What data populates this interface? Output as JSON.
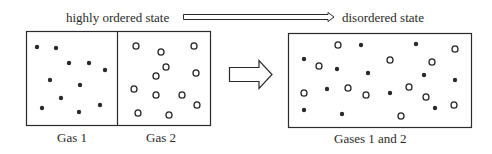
{
  "labels": {
    "ordered": "highly ordered state",
    "disordered": "disordered state",
    "gas1": "Gas 1",
    "gas2": "Gas 2",
    "mixed": "Gases 1 and 2"
  },
  "colors": {
    "stroke": "#2a2a2a",
    "background": "#ffffff"
  },
  "left_container": {
    "x": 26,
    "y": 31,
    "width": 184,
    "height": 94,
    "divider_x": 117,
    "gas1_particles": [
      [
        37,
        47
      ],
      [
        56,
        48
      ],
      [
        69,
        63
      ],
      [
        89,
        63
      ],
      [
        105,
        70
      ],
      [
        50,
        80
      ],
      [
        80,
        85
      ],
      [
        61,
        98
      ],
      [
        42,
        108
      ],
      [
        79,
        112
      ],
      [
        100,
        105
      ]
    ],
    "gas2_particles": [
      [
        136,
        46
      ],
      [
        161,
        52
      ],
      [
        194,
        46
      ],
      [
        166,
        67
      ],
      [
        156,
        76
      ],
      [
        196,
        73
      ],
      [
        134,
        89
      ],
      [
        156,
        95
      ],
      [
        182,
        95
      ],
      [
        197,
        105
      ],
      [
        138,
        113
      ],
      [
        169,
        115
      ]
    ]
  },
  "right_container": {
    "x": 288,
    "y": 33,
    "width": 183,
    "height": 94,
    "gas1_particles": [
      [
        361,
        45
      ],
      [
        304,
        59
      ],
      [
        337,
        69
      ],
      [
        368,
        73
      ],
      [
        327,
        89
      ],
      [
        390,
        93
      ],
      [
        304,
        110
      ],
      [
        342,
        114
      ],
      [
        416,
        44
      ],
      [
        424,
        75
      ],
      [
        455,
        80
      ],
      [
        435,
        108
      ]
    ],
    "gas2_particles": [
      [
        338,
        45
      ],
      [
        319,
        66
      ],
      [
        390,
        60
      ],
      [
        304,
        93
      ],
      [
        348,
        88
      ],
      [
        366,
        95
      ],
      [
        455,
        49
      ],
      [
        432,
        62
      ],
      [
        409,
        87
      ],
      [
        426,
        97
      ],
      [
        454,
        105
      ],
      [
        401,
        116
      ]
    ]
  }
}
